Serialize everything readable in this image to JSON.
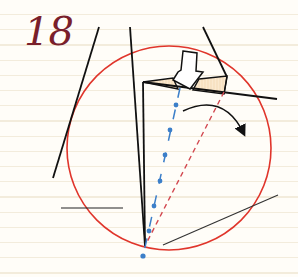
{
  "step": {
    "number": "18"
  },
  "diagram": {
    "colors": {
      "background": "#fffdf8",
      "ruled_line": "#f3ecdc",
      "step_number": "#7a1f2b",
      "outline": "#111111",
      "circle": "#e0352b",
      "valley_fold_line": "#3c7fc9",
      "mountain_fold_line": "#d2474f",
      "flap_fill": "#fbe9cf"
    },
    "elements": [
      {
        "id": "guide-circle",
        "type": "circle",
        "cx": 169,
        "cy": 148,
        "r": 102
      },
      {
        "id": "valley-fold-line",
        "type": "dash-dot line",
        "color": "blue"
      },
      {
        "id": "mountain-fold-line",
        "type": "dashed line",
        "color": "red"
      },
      {
        "id": "push-arrow",
        "type": "hollow arrow",
        "direction": "down"
      },
      {
        "id": "rotate-arrow",
        "type": "curved arrow",
        "direction": "clockwise"
      }
    ]
  }
}
